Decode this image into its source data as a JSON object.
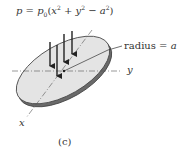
{
  "formula": {
    "lhs": "p",
    "eq": " = ",
    "coef": "p",
    "coef_sub": "0",
    "open": "(",
    "x": "x",
    "x_exp": "2",
    "plus": " + ",
    "y": "y",
    "y_exp": "2",
    "minus": " − ",
    "a": "a",
    "a_exp": "2",
    "close": ")"
  },
  "labels": {
    "radius_text": "radius = ",
    "radius_var": "a",
    "y_axis": "y",
    "x_axis": "x",
    "caption": "(c)"
  },
  "colors": {
    "disk_top": "#e4e4e4",
    "disk_edge": "#6a6a6a",
    "outline": "#444444",
    "arrow": "#222222",
    "axis": "#555555"
  }
}
